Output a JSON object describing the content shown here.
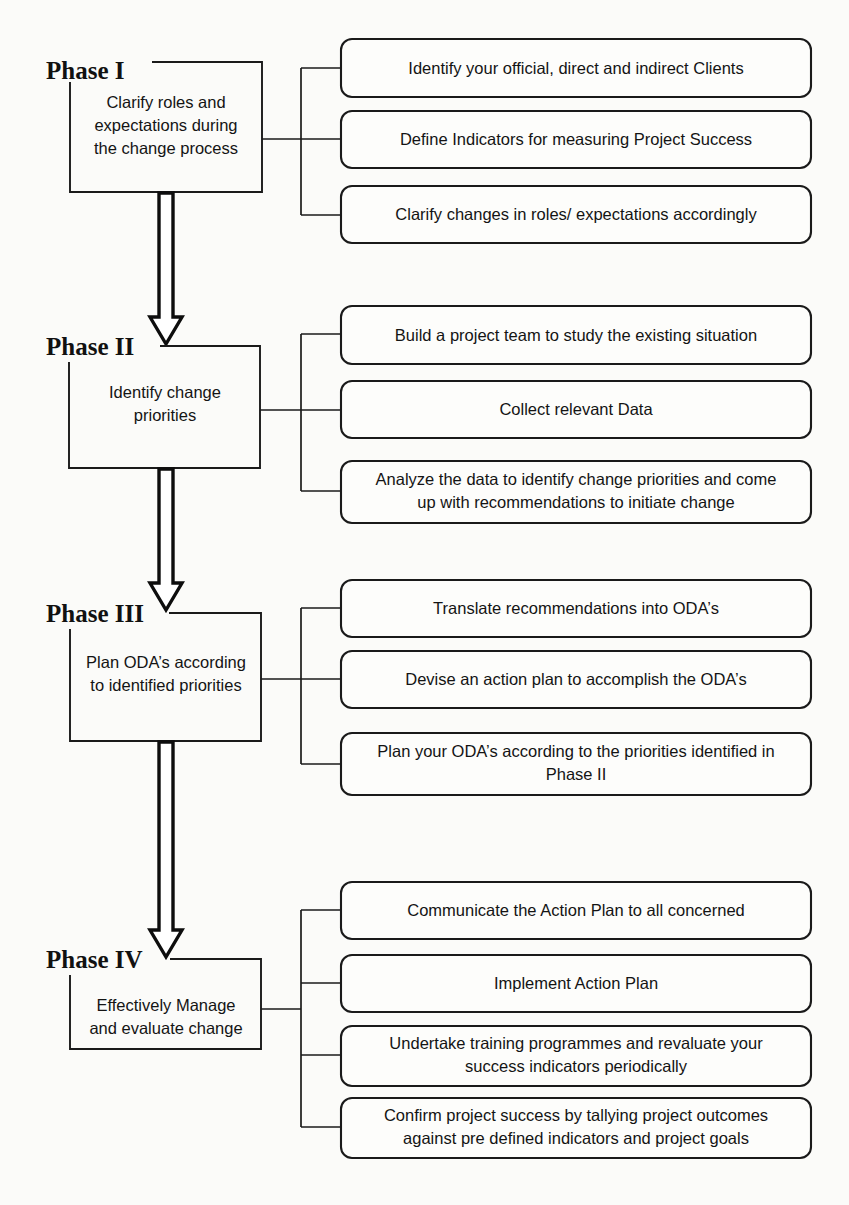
{
  "diagram": {
    "type": "flowchart",
    "orientation": "vertical-with-branches",
    "colors": {
      "stroke": "#1a1a1a",
      "background": "#fbfbf9",
      "text": "#141414"
    },
    "phases": [
      {
        "label": "Phase I",
        "description": "Clarify roles and expectations during the change process",
        "description_lines": [
          "Clarify roles and",
          "expectations during",
          "the change process"
        ],
        "tasks": [
          {
            "text": "Identify your official, direct and indirect Clients",
            "lines": [
              "Identify your official, direct and indirect Clients"
            ]
          },
          {
            "text": "Define Indicators for measuring Project Success",
            "lines": [
              "Define Indicators for measuring Project Success"
            ]
          },
          {
            "text": "Clarify changes in roles/ expectations  accordingly",
            "lines": [
              "Clarify changes in roles/ expectations  accordingly"
            ]
          }
        ]
      },
      {
        "label": "Phase II",
        "description": "Identify change priorities",
        "description_lines": [
          "Identify change",
          "priorities"
        ],
        "tasks": [
          {
            "text": "Build a project team to study the existing situation",
            "lines": [
              "Build a project team to study the existing situation"
            ]
          },
          {
            "text": "Collect relevant Data",
            "lines": [
              "Collect relevant Data"
            ]
          },
          {
            "text": "Analyze the data to identify change priorities and come up with recommendations to initiate change",
            "lines": [
              "Analyze the data to identify change priorities and come",
              "up with recommendations to initiate change"
            ]
          }
        ]
      },
      {
        "label": "Phase III",
        "description": "Plan ODA’s according to identified priorities",
        "description_lines": [
          "Plan ODA’s according",
          "to identified priorities"
        ],
        "tasks": [
          {
            "text": "Translate recommendations into ODA’s",
            "lines": [
              "Translate recommendations into ODA’s"
            ]
          },
          {
            "text": "Devise an action plan to accomplish the ODA’s",
            "lines": [
              "Devise an action plan to accomplish the ODA’s"
            ]
          },
          {
            "text": "Plan your ODA’s according to the priorities identified in Phase II",
            "lines": [
              "Plan your ODA’s according to the priorities identified in",
              "Phase II"
            ]
          }
        ]
      },
      {
        "label": "Phase IV",
        "description": "Effectively Manage and evaluate change",
        "description_lines": [
          "Effectively Manage",
          "and evaluate change"
        ],
        "tasks": [
          {
            "text": "Communicate the Action Plan to all concerned",
            "lines": [
              "Communicate the Action Plan to all concerned"
            ]
          },
          {
            "text": "Implement Action Plan",
            "lines": [
              "Implement Action Plan"
            ]
          },
          {
            "text": "Undertake training programmes  and revaluate your success indicators periodically",
            "lines": [
              "Undertake training programmes  and revaluate your",
              "success indicators periodically"
            ]
          },
          {
            "text": "Confirm project success by tallying project outcomes against pre defined indicators and project goals",
            "lines": [
              "Confirm project success by tallying project outcomes",
              "against pre defined indicators and project goals"
            ]
          }
        ]
      }
    ],
    "flow_arrows": [
      {
        "from": "Phase I",
        "to": "Phase II",
        "style": "hollow-block-arrow-down"
      },
      {
        "from": "Phase II",
        "to": "Phase III",
        "style": "hollow-block-arrow-down"
      },
      {
        "from": "Phase III",
        "to": "Phase IV",
        "style": "hollow-block-arrow-down"
      }
    ]
  }
}
